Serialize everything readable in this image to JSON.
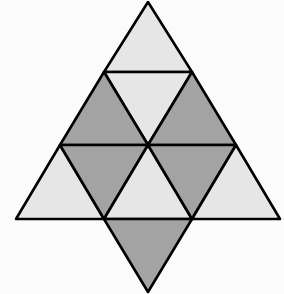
{
  "figure": {
    "colors": {
      "light": "#e6e6e6",
      "dark": "#a3a3a3",
      "stroke": "#000000",
      "background": "#fbfbfb"
    },
    "triangles": [
      {
        "id": "top",
        "points": "148,2 104,72 192,72",
        "shade": "light"
      },
      {
        "id": "row2-center-inverted",
        "points": "104,72 192,72 148,145",
        "shade": "light"
      },
      {
        "id": "row2-left",
        "points": "104,72 60,145 148,145",
        "shade": "dark"
      },
      {
        "id": "row2-right",
        "points": "192,72 148,145 236,145",
        "shade": "dark"
      },
      {
        "id": "row3-left",
        "points": "60,145 16,219 104,219",
        "shade": "light"
      },
      {
        "id": "row3-left-inverted",
        "points": "60,145 148,145 104,219",
        "shade": "dark"
      },
      {
        "id": "row3-center",
        "points": "148,145 104,219 192,219",
        "shade": "light"
      },
      {
        "id": "row3-right-inverted",
        "points": "148,145 236,145 192,219",
        "shade": "dark"
      },
      {
        "id": "row3-right",
        "points": "236,145 192,219 280,219",
        "shade": "light"
      },
      {
        "id": "bottom-inverted",
        "points": "104,219 192,219 148,292",
        "shade": "dark"
      }
    ]
  }
}
